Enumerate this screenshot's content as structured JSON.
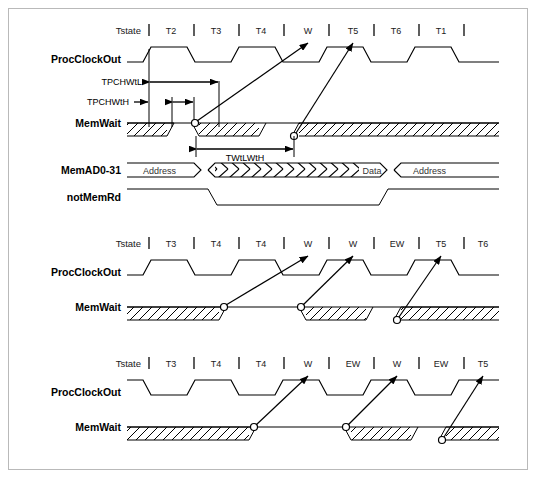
{
  "figure": {
    "kind": "timing-diagram",
    "background": "#ffffff",
    "border_color": "#b9b9b9",
    "ink_color": "#000000"
  },
  "diagrams": [
    {
      "id": "diagram-1",
      "tstate_title": "Tstate",
      "tstates": [
        "T2",
        "T3",
        "T4",
        "W",
        "T5",
        "T6",
        "T1"
      ],
      "signals": [
        "ProcClockOut",
        "MemWait",
        "MemAD0-31",
        "notMemRd"
      ],
      "bus_segments": [
        {
          "label": "Address"
        },
        {
          "label": ""
        },
        {
          "label": "Data"
        },
        {
          "label": "Address"
        }
      ],
      "timing_params": [
        "TPCHWtL",
        "TPCHWtH",
        "TWtLWtH"
      ]
    },
    {
      "id": "diagram-2",
      "tstate_title": "Tstate",
      "tstates": [
        "T3",
        "T4",
        "T4",
        "W",
        "W",
        "EW",
        "T5",
        "T6"
      ],
      "signals": [
        "ProcClockOut",
        "MemWait"
      ]
    },
    {
      "id": "diagram-3",
      "tstate_title": "Tstate",
      "tstates": [
        "T3",
        "T4",
        "T4",
        "W",
        "EW",
        "W",
        "EW",
        "T5"
      ],
      "signals": [
        "ProcClockOut",
        "MemWait"
      ]
    }
  ],
  "labels": {
    "tstate": "Tstate",
    "proc_clock_out": "ProcClockOut",
    "mem_wait": "MemWait",
    "mem_ad": "MemAD0-31",
    "not_mem_rd": "notMemRd",
    "tpchwtl": "TPCHWtL",
    "tpchwth": "TPCHWtH",
    "twtlwth": "TWtLWtH",
    "address": "Address",
    "data": "Data"
  }
}
